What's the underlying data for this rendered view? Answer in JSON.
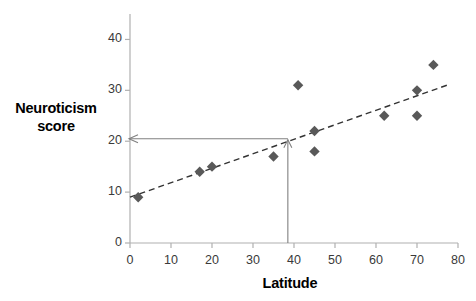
{
  "chart_data": {
    "type": "scatter",
    "title": "",
    "xlabel": "Latitude",
    "ylabel": "Neuroticism score",
    "xlim": [
      0,
      80
    ],
    "ylim": [
      0,
      45
    ],
    "xticks": [
      0,
      10,
      20,
      30,
      40,
      50,
      60,
      70,
      80
    ],
    "xticklabels": [
      "0",
      "10",
      "20",
      "30",
      "40",
      "50",
      "60",
      "70",
      "80"
    ],
    "yticks": [
      0,
      10,
      20,
      30,
      40
    ],
    "yticklabels": [
      "0",
      "10",
      "20",
      "30",
      "40"
    ],
    "grid": false,
    "legend": false,
    "marker": "diamond",
    "marker_color": "#595959",
    "points": [
      {
        "x": 2,
        "y": 9
      },
      {
        "x": 17,
        "y": 14
      },
      {
        "x": 20,
        "y": 15
      },
      {
        "x": 35,
        "y": 17
      },
      {
        "x": 41,
        "y": 31
      },
      {
        "x": 45,
        "y": 22
      },
      {
        "x": 45,
        "y": 18
      },
      {
        "x": 62,
        "y": 25
      },
      {
        "x": 70,
        "y": 25
      },
      {
        "x": 70,
        "y": 30
      },
      {
        "x": 74,
        "y": 35
      }
    ],
    "trendline": {
      "style": "dashed",
      "color": "#333333",
      "x_start": 0,
      "y_start": 9,
      "x_end": 78,
      "y_end": 31.2
    },
    "annotations": {
      "color": "#808080",
      "prediction_x": 38.5,
      "prediction_y": 20.5,
      "vertical_guide": {
        "x": 38.5,
        "y_from": 0,
        "y_to": 20.5,
        "arrow": "up"
      },
      "horizontal_guide": {
        "y": 20.5,
        "x_from": 38.5,
        "x_to": 0,
        "arrow": "left"
      }
    }
  },
  "axis_titles": {
    "y_line1": "Neuroticism",
    "y_line2": "score",
    "x": "Latitude"
  }
}
